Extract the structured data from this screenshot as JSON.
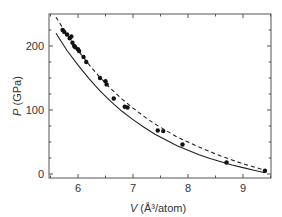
{
  "chart_data": {
    "type": "scatter",
    "title": "",
    "xlabel_var": "V",
    "xlabel_unit": " (Å³/atom)",
    "ylabel_var": "P",
    "ylabel_unit": " (GPa)",
    "xlim": [
      5.45,
      9.5
    ],
    "ylim": [
      -7,
      250
    ],
    "x_ticks": [
      6,
      7,
      8,
      9
    ],
    "x_minor_ticks": [
      5.5,
      6.5,
      7.5,
      8.5,
      9.5
    ],
    "y_ticks": [
      0,
      100,
      200
    ],
    "y_minor_ticks": [
      25,
      50,
      75,
      125,
      150,
      175,
      225
    ],
    "grid": false,
    "legend": null,
    "series": [
      {
        "name": "experimental data",
        "kind": "points",
        "marker": "filled-circle",
        "x": [
          5.72,
          5.75,
          5.8,
          5.85,
          5.88,
          5.9,
          5.93,
          5.95,
          6.0,
          6.02,
          6.1,
          6.15,
          6.4,
          6.5,
          6.52,
          6.65,
          6.85,
          6.9,
          7.45,
          7.55,
          7.9,
          8.7,
          9.4
        ],
        "y": [
          225,
          222,
          218,
          212,
          215,
          205,
          200,
          198,
          195,
          192,
          183,
          175,
          150,
          145,
          140,
          118,
          105,
          104,
          68,
          67,
          46,
          18,
          5
        ]
      },
      {
        "name": "fit (dashed)",
        "kind": "line",
        "style": "dashed",
        "x": [
          5.6,
          5.8,
          6.0,
          6.2,
          6.4,
          6.6,
          6.8,
          7.0,
          7.2,
          7.4,
          7.6,
          7.8,
          8.0,
          8.2,
          8.4,
          8.6,
          8.8,
          9.0,
          9.2,
          9.4
        ],
        "y": [
          245,
          218,
          193,
          171,
          151,
          133,
          117,
          103,
          90,
          78,
          68,
          58,
          50,
          42,
          35,
          28,
          22,
          16,
          11,
          6
        ]
      },
      {
        "name": "theory (solid)",
        "kind": "line",
        "style": "solid",
        "x": [
          5.6,
          5.8,
          6.0,
          6.2,
          6.4,
          6.6,
          6.8,
          7.0,
          7.2,
          7.4,
          7.6,
          7.8,
          8.0,
          8.2,
          8.4,
          8.6,
          8.8,
          9.0,
          9.2,
          9.4
        ],
        "y": [
          220,
          193,
          170,
          149,
          130,
          113,
          98,
          85,
          73,
          62,
          53,
          44,
          37,
          30,
          24,
          19,
          14,
          10,
          6,
          2
        ]
      }
    ]
  }
}
